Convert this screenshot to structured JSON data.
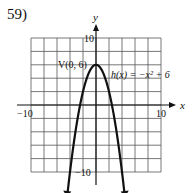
{
  "problem_number": "59)",
  "chart_data": {
    "type": "line",
    "title": "",
    "function_label": "h(x) = −x² + 6",
    "vertex_label": "V(0, 6)",
    "xlabel": "x",
    "ylabel": "y",
    "xlim": [
      -10,
      10
    ],
    "ylim": [
      -10,
      10
    ],
    "x_tick_labels": [
      "−10",
      "10"
    ],
    "y_tick_labels": [
      "10",
      "−10"
    ],
    "grid": true,
    "grid_step": 2,
    "series": [
      {
        "name": "h(x) = -x^2 + 6",
        "x": [
          -4.5,
          -4,
          -3,
          -2,
          -1,
          0,
          1,
          2,
          3,
          4,
          4.5
        ],
        "y": [
          -14.25,
          -10,
          -3,
          2,
          5,
          6,
          5,
          2,
          -3,
          -10,
          -14.25
        ]
      }
    ],
    "vertex": [
      0,
      6
    ]
  },
  "labels": {
    "x_axis": "x",
    "y_axis": "y",
    "x_min": "−10",
    "x_max": "10",
    "y_max": "10",
    "y_min": "−10",
    "vertex": "V(0, 6)",
    "function": "h(x) = −x² + 6"
  }
}
